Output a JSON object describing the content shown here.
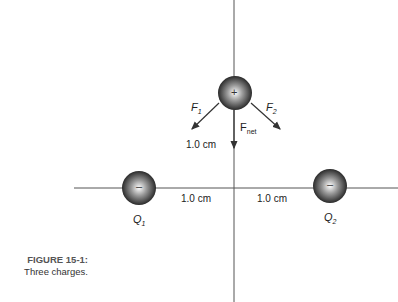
{
  "figure": {
    "caption_label": "FIGURE 15-1:",
    "caption_text": "Three charges."
  },
  "charges": {
    "top": {
      "sign": "+"
    },
    "q1": {
      "sign": "–",
      "name": "Q",
      "sub": "1"
    },
    "q2": {
      "sign": "–",
      "name": "Q",
      "sub": "2"
    }
  },
  "forces": {
    "f1": {
      "name": "F",
      "sub": "1"
    },
    "f2": {
      "name": "F",
      "sub": "2"
    },
    "fnet": {
      "name": "F",
      "sub": "net"
    }
  },
  "distances": {
    "vertical": "1.0 cm",
    "left": "1.0 cm",
    "right": "1.0 cm"
  }
}
